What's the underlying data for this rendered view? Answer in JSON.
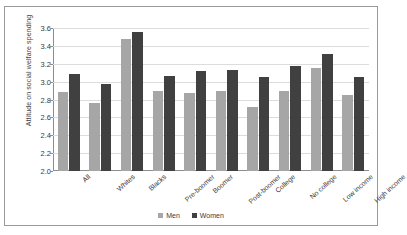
{
  "chart_data": {
    "type": "bar",
    "title": "",
    "xlabel": "",
    "ylabel": "Attitude on social welfare spending",
    "ylim": [
      2.0,
      3.6
    ],
    "ytick_step": 0.2,
    "yticks": [
      "2.0",
      "2.2",
      "2.4",
      "2.6",
      "2.8",
      "3.0",
      "3.2",
      "3.4",
      "3.6"
    ],
    "grid": "horizontal",
    "legend_position": "bottom-center",
    "categories": [
      "All",
      "Whites",
      "Blacks",
      "Pre-boomer",
      "Boomer",
      "Post-boomer",
      "College",
      "No college",
      "Low income",
      "High income"
    ],
    "series": [
      {
        "name": "Men",
        "color": "#a6a6a6",
        "values": [
          2.88,
          2.76,
          3.48,
          2.9,
          2.87,
          2.9,
          2.72,
          2.9,
          3.15,
          2.85
        ]
      },
      {
        "name": "Women",
        "color": "#404040",
        "values": [
          3.09,
          2.97,
          3.55,
          3.06,
          3.12,
          3.13,
          3.05,
          3.17,
          3.31,
          3.05
        ]
      }
    ]
  },
  "legend": {
    "items": [
      {
        "label": "Men"
      },
      {
        "label": "Women"
      }
    ]
  }
}
